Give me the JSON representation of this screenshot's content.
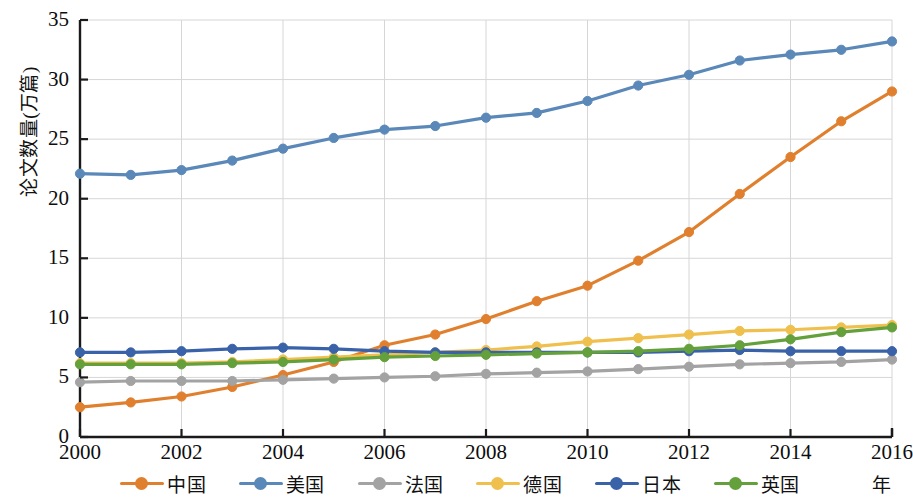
{
  "chart_data": {
    "type": "line",
    "title": "",
    "subtitle": "",
    "xlabel": "年",
    "ylabel": "论文数量(万篇)",
    "x": [
      2000,
      2001,
      2002,
      2003,
      2004,
      2005,
      2006,
      2007,
      2008,
      2009,
      2010,
      2011,
      2012,
      2013,
      2014,
      2015,
      2016
    ],
    "xlim": [
      2000,
      2016
    ],
    "ylim": [
      0,
      35
    ],
    "xticks": [
      "2000",
      "2002",
      "2004",
      "2006",
      "2008",
      "2010",
      "2012",
      "2014",
      "2016"
    ],
    "xtick_values": [
      2000,
      2002,
      2004,
      2006,
      2008,
      2010,
      2012,
      2014,
      2016
    ],
    "yticks": [
      "0",
      "5",
      "10",
      "15",
      "20",
      "25",
      "30",
      "35"
    ],
    "ytick_values": [
      0,
      5,
      10,
      15,
      20,
      25,
      30,
      35
    ],
    "grid": true,
    "grid_axis": "both",
    "legend_position": "bottom",
    "marker": "circle",
    "series": [
      {
        "name": "中国",
        "color": "#E0802E",
        "values": [
          2.5,
          2.9,
          3.4,
          4.2,
          5.2,
          6.3,
          7.7,
          8.6,
          9.9,
          11.4,
          12.7,
          14.8,
          17.2,
          20.4,
          23.5,
          26.5,
          29.0
        ]
      },
      {
        "name": "美国",
        "color": "#5A88B8",
        "values": [
          22.1,
          22.0,
          22.4,
          23.2,
          24.2,
          25.1,
          25.8,
          26.1,
          26.8,
          27.2,
          28.2,
          29.5,
          30.4,
          31.6,
          32.1,
          32.5,
          33.2
        ]
      },
      {
        "name": "法国",
        "color": "#A3A3A3",
        "values": [
          4.6,
          4.7,
          4.7,
          4.7,
          4.8,
          4.9,
          5.0,
          5.1,
          5.3,
          5.4,
          5.5,
          5.7,
          5.9,
          6.1,
          6.2,
          6.3,
          6.5
        ]
      },
      {
        "name": "德国",
        "color": "#F0C04E",
        "values": [
          6.2,
          6.2,
          6.2,
          6.3,
          6.5,
          6.7,
          6.9,
          7.1,
          7.3,
          7.6,
          8.0,
          8.3,
          8.6,
          8.9,
          9.0,
          9.2,
          9.4
        ]
      },
      {
        "name": "日本",
        "color": "#3A62A8",
        "values": [
          7.1,
          7.1,
          7.2,
          7.4,
          7.5,
          7.4,
          7.2,
          7.1,
          7.1,
          7.1,
          7.1,
          7.1,
          7.2,
          7.3,
          7.2,
          7.2,
          7.2
        ]
      },
      {
        "name": "英国",
        "color": "#64A03C",
        "values": [
          6.1,
          6.1,
          6.1,
          6.2,
          6.3,
          6.5,
          6.7,
          6.8,
          6.9,
          7.0,
          7.1,
          7.2,
          7.4,
          7.7,
          8.2,
          8.8,
          9.2
        ]
      }
    ]
  },
  "legend": {
    "items": [
      {
        "label": "中国",
        "color": "#E0802E"
      },
      {
        "label": "美国",
        "color": "#5A88B8"
      },
      {
        "label": "法国",
        "color": "#A3A3A3"
      },
      {
        "label": "德国",
        "color": "#F0C04E"
      },
      {
        "label": "日本",
        "color": "#3A62A8"
      },
      {
        "label": "英国",
        "color": "#64A03C"
      }
    ]
  },
  "axes": {
    "y_title": "论文数量(万篇)",
    "x_title": "年"
  }
}
